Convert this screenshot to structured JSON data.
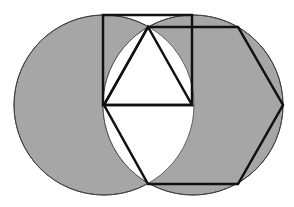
{
  "figure": {
    "width": 294,
    "height": 207,
    "background": "#ffffff",
    "fill_color": "#a6a6a6",
    "stroke_color": "#111111",
    "circles": [
      {
        "name": "left-circle",
        "cx": 104,
        "cy": 105,
        "r": 90
      },
      {
        "name": "right-circle",
        "cx": 193,
        "cy": 105,
        "r": 90
      }
    ],
    "lens_points": {
      "top": "148,27",
      "bottom": "148,183"
    },
    "square": {
      "points": "103,15 192,15 192,105 103,105"
    },
    "triangle": {
      "points": "148,27 104,105 192,105"
    },
    "hexagon": {
      "points": "148,27 238,27 283,105 238,184 148,184 104,105"
    }
  }
}
